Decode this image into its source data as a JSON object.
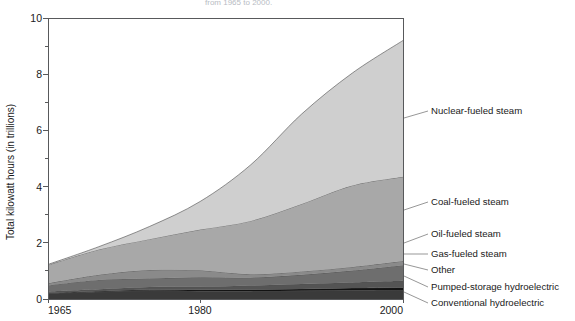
{
  "chart_data": {
    "type": "area",
    "stacked": true,
    "title": "from 1965 to 2000.",
    "xlabel": "",
    "ylabel": "Total kilowatt hours (in trillions)",
    "xlim": [
      1965,
      2000
    ],
    "ylim": [
      0,
      10
    ],
    "grid": false,
    "legend_position": "right-labels-with-leader-lines",
    "x_ticks": [
      "1965",
      "1980",
      "2000"
    ],
    "x_tick_values": [
      1965,
      1980,
      2000
    ],
    "y_ticks": [
      "0",
      "2",
      "4",
      "6",
      "8",
      "10"
    ],
    "y_tick_values": [
      0,
      2,
      4,
      6,
      8,
      10
    ],
    "y_minor_tick_values": [
      1,
      3,
      5,
      7,
      9
    ],
    "x": [
      1965,
      1970,
      1975,
      1980,
      1985,
      1990,
      1995,
      2000
    ],
    "series": [
      {
        "name": "Conventional hydroelectric",
        "color": "#3a3a3a",
        "values": [
          0.2,
          0.25,
          0.3,
          0.28,
          0.28,
          0.29,
          0.31,
          0.32
        ]
      },
      {
        "name": "Pumped-storage hydroelectric",
        "color": "#121212",
        "values": [
          0.02,
          0.03,
          0.04,
          0.05,
          0.06,
          0.07,
          0.08,
          0.09
        ]
      },
      {
        "name": "Other",
        "color": "#545454",
        "values": [
          0.05,
          0.07,
          0.09,
          0.11,
          0.14,
          0.17,
          0.2,
          0.24
        ]
      },
      {
        "name": "Gas-fueled steam",
        "color": "#6e6e6e",
        "values": [
          0.22,
          0.33,
          0.3,
          0.33,
          0.28,
          0.33,
          0.42,
          0.55
        ]
      },
      {
        "name": "Oil-fueled steam",
        "color": "#8a8a8a",
        "values": [
          0.07,
          0.18,
          0.3,
          0.25,
          0.12,
          0.12,
          0.13,
          0.15
        ]
      },
      {
        "name": "Coal-fueled steam",
        "color": "#a8a8a8",
        "values": [
          0.65,
          0.9,
          1.1,
          1.45,
          1.9,
          2.4,
          2.9,
          3.0
        ]
      },
      {
        "name": "Nuclear-fueled steam",
        "color": "#cfcfcf",
        "values": [
          0.02,
          0.1,
          0.45,
          1.0,
          2.0,
          3.2,
          4.0,
          4.85
        ]
      }
    ],
    "series_labels": [
      "Nuclear-fueled steam",
      "Coal-fueled steam",
      "Oil-fueled steam",
      "Gas-fueled steam",
      "Other",
      "Pumped-storage hydroelectric",
      "Conventional hydroelectric"
    ],
    "total_at_1965": 1.23,
    "total_at_2000": 9.2
  },
  "layout": {
    "plot_left": 48,
    "plot_right": 403,
    "plot_top": 18,
    "plot_bottom": 299
  },
  "labels": {
    "nuclear": "Nuclear-fueled steam",
    "coal": "Coal-fueled steam",
    "oil": "Oil-fueled steam",
    "gas": "Gas-fueled steam",
    "other": "Other",
    "pumped": "Pumped-storage hydroelectric",
    "conventional": "Conventional hydroelectric"
  },
  "axis": {
    "y_title": "Total kilowatt hours (in trillions)",
    "y_0": "0",
    "y_2": "2",
    "y_4": "4",
    "y_6": "6",
    "y_8": "8",
    "y_10": "10",
    "x_1965": "1965",
    "x_1980": "1980",
    "x_2000": "2000"
  },
  "title": {
    "text": "from 1965 to 2000."
  }
}
